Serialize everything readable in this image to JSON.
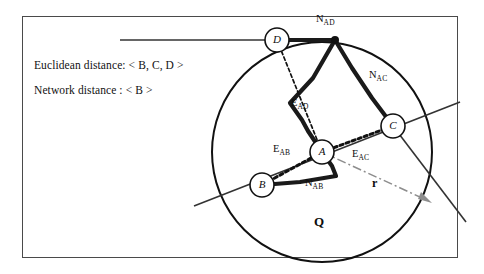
{
  "figure": {
    "legend": {
      "euclidean": "Euclidean distance: < B, C, D >",
      "network": "Network distance  : < B >"
    },
    "region_label": "Q",
    "radius_label": "r",
    "nodes": [
      {
        "id": "A",
        "label": "A",
        "cx": 322,
        "cy": 152,
        "r": 12
      },
      {
        "id": "B",
        "label": "B",
        "cx": 262,
        "cy": 185,
        "r": 12
      },
      {
        "id": "C",
        "label": "C",
        "cx": 393,
        "cy": 126,
        "r": 12
      },
      {
        "id": "D",
        "label": "D",
        "cx": 277,
        "cy": 40,
        "r": 12
      }
    ],
    "edge_labels": [
      {
        "id": "N_AD",
        "base": "N",
        "sub": "AD",
        "x": 316,
        "y": 17
      },
      {
        "id": "N_AC",
        "base": "N",
        "sub": "AC",
        "x": 369,
        "y": 73
      },
      {
        "id": "E_AD",
        "base": "E",
        "sub": "AD",
        "x": 291,
        "y": 101
      },
      {
        "id": "E_AC",
        "base": "E",
        "sub": "AC",
        "x": 352,
        "y": 152
      },
      {
        "id": "E_AB",
        "base": "E",
        "sub": "AB",
        "x": 273,
        "y": 147
      },
      {
        "id": "N_AB",
        "base": "N",
        "sub": "AB",
        "x": 305,
        "y": 181
      }
    ],
    "circle": {
      "cx": 322,
      "cy": 152,
      "r": 110
    },
    "colors": {
      "frame": "#4a4a4a",
      "stroke": "#111111",
      "network_path": "#1a1a1a",
      "euclidean_path": "#1a1a1a",
      "radius_arrow": "#8d8d8d",
      "background": "#ffffff"
    }
  }
}
